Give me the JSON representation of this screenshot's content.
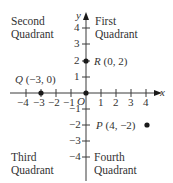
{
  "figure": {
    "quadrants": {
      "first": {
        "line1": "First",
        "line2": "Quadrant"
      },
      "second": {
        "line1": "Second",
        "line2": "Quadrant"
      },
      "third": {
        "line1": "Third",
        "line2": "Quadrant"
      },
      "fourth": {
        "line1": "Fourth",
        "line2": "Quadrant"
      }
    },
    "axes": {
      "x_label": "x",
      "y_label": "y",
      "origin_label": "O",
      "x_ticks": [
        "-4",
        "-3",
        "-2",
        "-1",
        "1",
        "2",
        "3",
        "4"
      ],
      "y_ticks": [
        "4",
        "3",
        "2",
        "1",
        "-1",
        "-2",
        "-3",
        "-4"
      ]
    },
    "points": {
      "Q": {
        "name": "Q",
        "coords": "(−3, 0)",
        "x": -3,
        "y": 0
      },
      "R": {
        "name": "R",
        "coords": "(0, 2)",
        "x": 0,
        "y": 2
      },
      "P": {
        "name": "P",
        "coords": "(4, −2)",
        "x": 4,
        "y": -2
      },
      "O": {
        "name": "O",
        "x": 0,
        "y": 0
      }
    },
    "colors": {
      "axis": "#3a3a3a",
      "text": "#333333",
      "point": "#1a1a1a"
    }
  }
}
